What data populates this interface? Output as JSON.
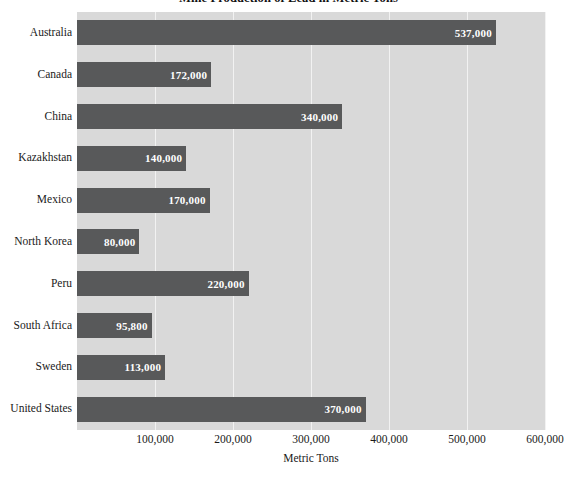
{
  "chart_data": {
    "type": "bar",
    "orientation": "horizontal",
    "title": "Mine Production of Lead in Metric Tons",
    "xlabel": "Metric Tons",
    "ylabel": "",
    "xlim": [
      0,
      600000
    ],
    "xticks": [
      100000,
      200000,
      300000,
      400000,
      500000,
      600000
    ],
    "xtick_labels": [
      "100,000",
      "200,000",
      "300,000",
      "400,000",
      "500,000",
      "600,000"
    ],
    "grid": true,
    "grid_axis": "x",
    "legend": false,
    "categories": [
      "Australia",
      "Canada",
      "China",
      "Kazakhstan",
      "Mexico",
      "North Korea",
      "Peru",
      "South Africa",
      "Sweden",
      "United States"
    ],
    "values": [
      537000,
      172000,
      340000,
      140000,
      170000,
      80000,
      220000,
      95800,
      113000,
      370000
    ],
    "value_labels": [
      "537,000",
      "172,000",
      "340,000",
      "140,000",
      "170,000",
      "80,000",
      "220,000",
      "95,800",
      "113,000",
      "370,000"
    ],
    "colors": {
      "bar": "#58595a",
      "plot_background": "#d9d9d9",
      "gridline": "#f2f2f2",
      "figure_background": "#ffffff",
      "value_label": "#ffffff",
      "text": "#1a1a1a"
    }
  }
}
